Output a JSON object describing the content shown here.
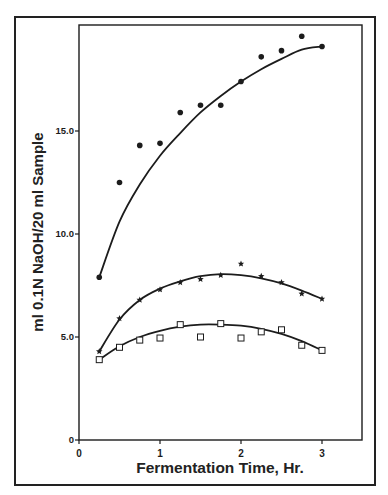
{
  "chart_data": {
    "type": "scatter",
    "title": "",
    "xlabel": "Fermentation Time, Hr.",
    "ylabel": "ml 0.1N NaOH/20 ml Sample",
    "xlim": [
      0,
      3.5
    ],
    "ylim": [
      0,
      20
    ],
    "x_ticks": [
      0,
      1,
      2,
      3
    ],
    "x_tick_labels": [
      "0",
      "1",
      "2",
      "3"
    ],
    "y_ticks": [
      0,
      5,
      10,
      15
    ],
    "y_tick_labels": [
      "0",
      "5.0",
      "10.0",
      "15.0"
    ],
    "grid": false,
    "legend": null,
    "x": [
      0.25,
      0.5,
      0.75,
      1.0,
      1.25,
      1.5,
      1.75,
      2.0,
      2.25,
      2.5,
      2.75,
      3.0
    ],
    "series": [
      {
        "name": "filled-circle series",
        "marker": "circle-filled",
        "values": [
          7.9,
          12.5,
          14.3,
          14.4,
          15.9,
          16.25,
          16.25,
          17.4,
          18.6,
          18.9,
          19.6,
          19.1
        ],
        "fit_curve": [
          [
            0.25,
            7.9
          ],
          [
            0.5,
            10.6
          ],
          [
            0.75,
            12.4
          ],
          [
            1.0,
            13.8
          ],
          [
            1.25,
            14.9
          ],
          [
            1.5,
            15.9
          ],
          [
            1.75,
            16.7
          ],
          [
            2.0,
            17.4
          ],
          [
            2.25,
            18.0
          ],
          [
            2.5,
            18.5
          ],
          [
            2.75,
            18.95
          ],
          [
            3.0,
            19.1
          ]
        ]
      },
      {
        "name": "star series",
        "marker": "star",
        "values": [
          4.3,
          5.9,
          6.8,
          7.3,
          7.65,
          7.8,
          8.0,
          8.55,
          7.95,
          7.65,
          7.1,
          6.85
        ],
        "fit_curve": [
          [
            0.25,
            4.3
          ],
          [
            0.5,
            5.85
          ],
          [
            0.75,
            6.8
          ],
          [
            1.0,
            7.35
          ],
          [
            1.25,
            7.7
          ],
          [
            1.5,
            7.95
          ],
          [
            1.75,
            8.05
          ],
          [
            2.0,
            8.0
          ],
          [
            2.25,
            7.85
          ],
          [
            2.5,
            7.6
          ],
          [
            2.75,
            7.25
          ],
          [
            3.0,
            6.85
          ]
        ]
      },
      {
        "name": "open-square series",
        "marker": "square-open",
        "values": [
          3.9,
          4.5,
          4.85,
          4.95,
          5.6,
          5.0,
          5.65,
          4.95,
          5.25,
          5.35,
          4.6,
          4.35
        ],
        "fit_curve": [
          [
            0.25,
            3.9
          ],
          [
            0.5,
            4.55
          ],
          [
            0.75,
            5.0
          ],
          [
            1.0,
            5.3
          ],
          [
            1.25,
            5.5
          ],
          [
            1.5,
            5.6
          ],
          [
            1.75,
            5.6
          ],
          [
            2.0,
            5.55
          ],
          [
            2.25,
            5.4
          ],
          [
            2.5,
            5.15
          ],
          [
            2.75,
            4.8
          ],
          [
            3.0,
            4.35
          ]
        ]
      }
    ]
  },
  "axes": {
    "x_title": "Fermentation Time, Hr.",
    "y_title": "ml 0.1N NaOH/20 ml Sample"
  }
}
